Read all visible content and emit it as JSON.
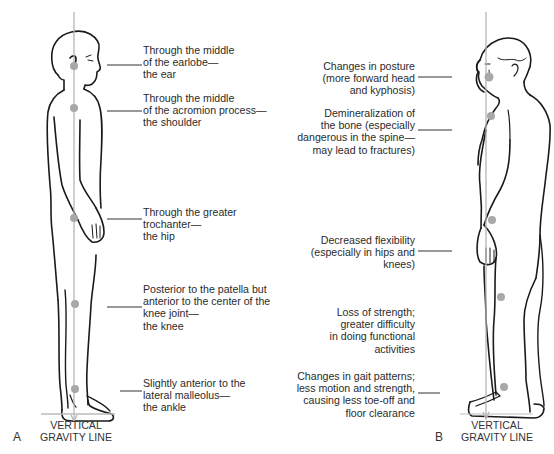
{
  "panel_a": {
    "letter": "A",
    "caption_line1": "VERTICAL",
    "caption_line2": "GRAVITY LINE",
    "labels": [
      {
        "text": "Through the middle\nof the earlobe—\nthe ear"
      },
      {
        "text": "Through the middle\nof the acromion process—\nthe shoulder"
      },
      {
        "text": "Through the greater\ntrochanter—\nthe hip"
      },
      {
        "text": "Posterior to the patella but\nanterior to the center of the\nknee joint—\nthe knee"
      },
      {
        "text": "Slightly anterior to the\nlateral malleolus—\nthe ankle"
      }
    ]
  },
  "panel_b": {
    "letter": "B",
    "caption_line1": "VERTICAL",
    "caption_line2": "GRAVITY LINE",
    "labels": [
      {
        "text": "Changes in posture\n(more forward head\nand kyphosis)"
      },
      {
        "text": "Demineralization of\nthe bone (especially\ndangerous in the spine—\nmay lead to fractures)"
      },
      {
        "text": "Decreased flexibility\n(especially in hips and\nknees)"
      },
      {
        "text": "Loss of strength;\ngreater difficulty\nin doing functional\nactivities"
      },
      {
        "text": "Changes in gait patterns;\nless motion and strength,\ncausing less toe-off and\nfloor clearance"
      }
    ]
  },
  "colors": {
    "outline": "#1a1a1a",
    "gravity_line": "#b5b5b5",
    "landmark_dot": "#a8a8a8",
    "leader_line": "#333333"
  }
}
